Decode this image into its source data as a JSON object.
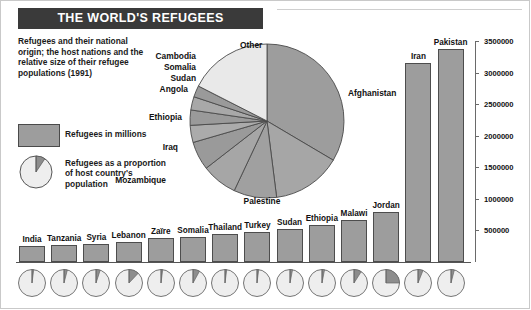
{
  "header": {
    "title": "THE WORLD'S REFUGEES",
    "description": "Refugees and their national origin; the host nations and the relative size of their refugee populations (1991)"
  },
  "legend": {
    "bar_label": "Refugees in millions",
    "pie_label": "Refugees as a proportion of host country's population",
    "swatch_color": "#9d9d9d",
    "sample_proportion": 0.09
  },
  "chart_data": [
    {
      "type": "pie",
      "title": "Refugees by national origin",
      "labels": [
        "Afghanistan",
        "Palestine",
        "Mozambique",
        "Iraq",
        "Ethiopia",
        "Angola",
        "Sudan",
        "Somalia",
        "Cambodia",
        "Other"
      ],
      "values": [
        33.5,
        14.5,
        9.0,
        7.5,
        6.0,
        3.6,
        3.2,
        2.8,
        2.4,
        17.5
      ],
      "unit": "percent"
    },
    {
      "type": "bar",
      "title": "Refugee populations by host nation (1991)",
      "categories": [
        "India",
        "Tanzania",
        "Syria",
        "Lebanon",
        "Zaïre",
        "Somalia",
        "Thailand",
        "Turkey",
        "Sudan",
        "Ethiopia",
        "Malawi",
        "Jordan",
        "Iran",
        "Pakistan"
      ],
      "values": [
        255000,
        270000,
        290000,
        320000,
        385000,
        400000,
        450000,
        470000,
        530000,
        590000,
        660000,
        790000,
        3150000,
        3380000
      ],
      "ylabel": "",
      "xlabel": "",
      "ylim": [
        0,
        3500000
      ],
      "yticks": [
        500000,
        1000000,
        1500000,
        2000000,
        2500000,
        3000000,
        3500000
      ],
      "ytick_labels": [
        "500000",
        "1000000",
        "1500000",
        "2000000",
        "2500000",
        "3000000",
        "3500000"
      ],
      "grid": false,
      "legend_position": "left"
    },
    {
      "type": "pie",
      "title": "Refugees as a proportion of host country population",
      "categories": [
        "India",
        "Tanzania",
        "Syria",
        "Lebanon",
        "Zaïre",
        "Somalia",
        "Thailand",
        "Turkey",
        "Sudan",
        "Ethiopia",
        "Malawi",
        "Jordan",
        "Iran",
        "Pakistan"
      ],
      "values": [
        0.02,
        0.04,
        0.05,
        0.12,
        0.02,
        0.08,
        0.02,
        0.02,
        0.03,
        0.03,
        0.09,
        0.25,
        0.06,
        0.04
      ],
      "unit": "fraction"
    }
  ]
}
